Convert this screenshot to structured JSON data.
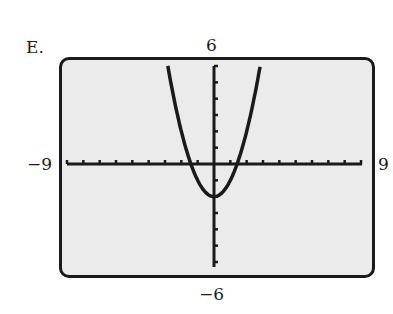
{
  "option_label": "E.",
  "window": {
    "xmin_label": "−9",
    "xmax_label": "9",
    "ymin_label": "−6",
    "ymax_label": "6"
  },
  "colors": {
    "screen_background": "#ebebeb",
    "ink": "#1a1a1a"
  },
  "chart_data": {
    "type": "line",
    "title": "",
    "xlabel": "",
    "ylabel": "",
    "xlim": [
      -9,
      9
    ],
    "ylim": [
      -6,
      6
    ],
    "xscale_tick": 1,
    "yscale_tick": 1,
    "grid": false,
    "legend": null,
    "series": [
      {
        "name": "y = x^2 - 2",
        "x": [
          -2.83,
          -2.5,
          -2,
          -1.5,
          -1.41,
          -1,
          -0.5,
          0,
          0.5,
          1,
          1.41,
          1.5,
          2,
          2.5,
          2.83
        ],
        "y": [
          6.0,
          4.25,
          2,
          0.25,
          0,
          -1,
          -1.75,
          -2,
          -1.75,
          -1,
          0,
          0.25,
          2,
          4.25,
          6.0
        ]
      }
    ],
    "annotations": {
      "vertex": [
        0,
        -2
      ],
      "x_intercepts": [
        -1.41,
        1.41
      ]
    }
  }
}
